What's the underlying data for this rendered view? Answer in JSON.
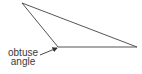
{
  "diagram": {
    "shape": "obtuse triangle",
    "vertices": [
      [
        22,
        3
      ],
      [
        58,
        47
      ],
      [
        137,
        47
      ]
    ],
    "stroke_color": "#555555",
    "label": {
      "line1": "obtuse",
      "line2": "angle"
    },
    "arrow_color": "#333333"
  }
}
